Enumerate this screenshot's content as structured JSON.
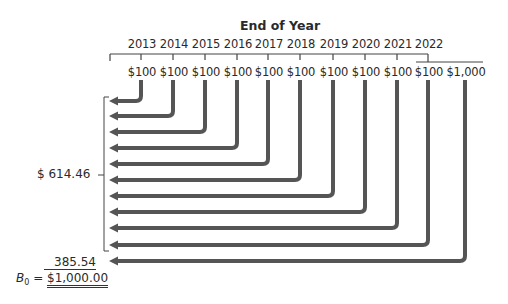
{
  "header": {
    "title": "End of Year"
  },
  "timeline": {
    "years": [
      "2013",
      "2014",
      "2015",
      "2016",
      "2017",
      "2018",
      "2019",
      "2020",
      "2021",
      "2022"
    ],
    "cash_flows": [
      "$100",
      "$100",
      "$100",
      "$100",
      "$100",
      "$100",
      "$100",
      "$100",
      "$100",
      "$100",
      "$1,000"
    ]
  },
  "summary": {
    "pv_coupons_label": "$  614.46",
    "pv_principal_label": "385.54",
    "bond_value_symbol": "B",
    "bond_value_subscript": "0",
    "bond_value_equals": " = ",
    "bond_value": "$1,000.00"
  },
  "colors": {
    "arrow": "#555555",
    "line": "#444444",
    "text": "#2a2a2a"
  },
  "layout": {
    "columns_x": [
      141,
      173,
      205,
      237,
      268,
      300,
      333,
      365,
      397,
      428,
      465
    ],
    "rows_y": [
      101,
      116,
      132,
      148,
      164,
      180,
      196,
      212,
      228,
      245,
      261
    ]
  }
}
